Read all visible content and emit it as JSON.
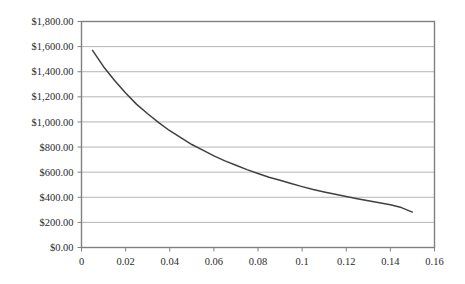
{
  "chart_data": {
    "type": "line",
    "title": "",
    "xlabel": "",
    "ylabel": "",
    "xlim": [
      0,
      0.16
    ],
    "ylim": [
      0,
      1800
    ],
    "grid": true,
    "legend": null,
    "legend_position": "none",
    "x_tick_labels": [
      "0",
      "0.02",
      "0.04",
      "0.06",
      "0.08",
      "0.1",
      "0.12",
      "0.14",
      "0.16"
    ],
    "x_tick_values": [
      0,
      0.02,
      0.04,
      0.06,
      0.08,
      0.1,
      0.12,
      0.14,
      0.16
    ],
    "y_tick_labels": [
      "$0.00",
      "$200.00",
      "$400.00",
      "$600.00",
      "$800.00",
      "$1,000.00",
      "$1,200.00",
      "$1,400.00",
      "$1,600.00",
      "$1,800.00"
    ],
    "y_tick_values": [
      0,
      200,
      400,
      600,
      800,
      1000,
      1200,
      1400,
      1600,
      1800
    ],
    "series": [
      {
        "name": "value",
        "color": "#404040",
        "x": [
          0.005,
          0.01,
          0.015,
          0.02,
          0.025,
          0.03,
          0.035,
          0.04,
          0.045,
          0.05,
          0.055,
          0.06,
          0.065,
          0.07,
          0.075,
          0.08,
          0.085,
          0.09,
          0.095,
          0.1,
          0.105,
          0.11,
          0.115,
          0.12,
          0.125,
          0.13,
          0.135,
          0.14,
          0.145,
          0.15
        ],
        "values": [
          1570,
          1440,
          1330,
          1230,
          1140,
          1065,
          995,
          930,
          875,
          820,
          775,
          730,
          690,
          655,
          620,
          590,
          560,
          535,
          510,
          485,
          462,
          442,
          424,
          406,
          389,
          373,
          357,
          340,
          318,
          282
        ]
      }
    ]
  },
  "axes": {
    "border_color": "#808080",
    "grid_color": "#b5b5b5",
    "tick_color": "#808080",
    "background": "#ffffff"
  }
}
